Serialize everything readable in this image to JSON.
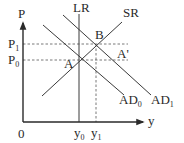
{
  "diagram": {
    "type": "AD-AS macroeconomic diagram",
    "axes": {
      "y_axis_label": "P",
      "x_axis_label": "y",
      "origin_label": "0"
    },
    "curves": {
      "lr": {
        "label": "LR"
      },
      "sr": {
        "label": "SR"
      },
      "ad0": {
        "label": "AD",
        "subscript": "0"
      },
      "ad1": {
        "label": "AD",
        "subscript": "1"
      }
    },
    "points": {
      "a": {
        "label": "A"
      },
      "b": {
        "label": "B"
      },
      "a_prime": {
        "label": "A'"
      }
    },
    "price_levels": {
      "p1": {
        "label": "P",
        "subscript": "1"
      },
      "p0": {
        "label": "P",
        "subscript": "0"
      }
    },
    "output_levels": {
      "y0": {
        "label": "y",
        "subscript": "0"
      },
      "y1": {
        "label": "y",
        "subscript": "1"
      }
    },
    "colors": {
      "axis": "#2a2a2a",
      "curve": "#3a3a3a",
      "dashed": "#555555",
      "background": "#ffffff"
    }
  }
}
